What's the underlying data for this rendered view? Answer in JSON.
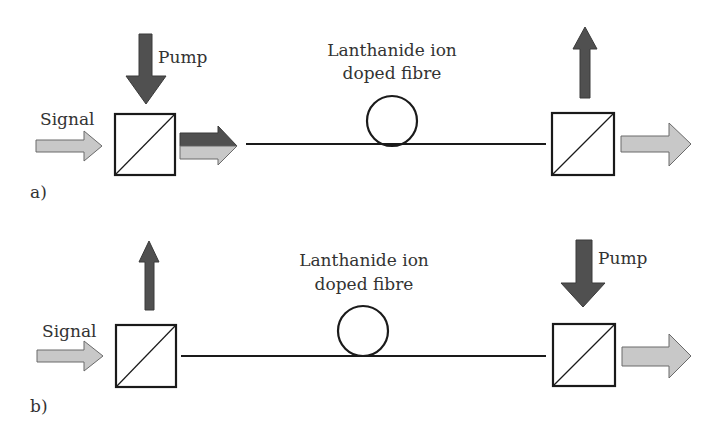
{
  "figure": {
    "colors": {
      "pump": "#505050",
      "signal": "#c8c8c8",
      "stroke": "#1a1a1a",
      "text": "#333333"
    },
    "panel_a": {
      "label": "a)",
      "signal_label": "Signal",
      "pump_label": "Pump",
      "fibre_label_line1": "Lanthanide ion",
      "fibre_label_line2": "doped fibre",
      "pump_direction": "co-propagating"
    },
    "panel_b": {
      "label": "b)",
      "signal_label": "Signal",
      "pump_label": "Pump",
      "fibre_label_line1": "Lanthanide ion",
      "fibre_label_line2": "doped fibre",
      "pump_direction": "counter-propagating"
    }
  }
}
